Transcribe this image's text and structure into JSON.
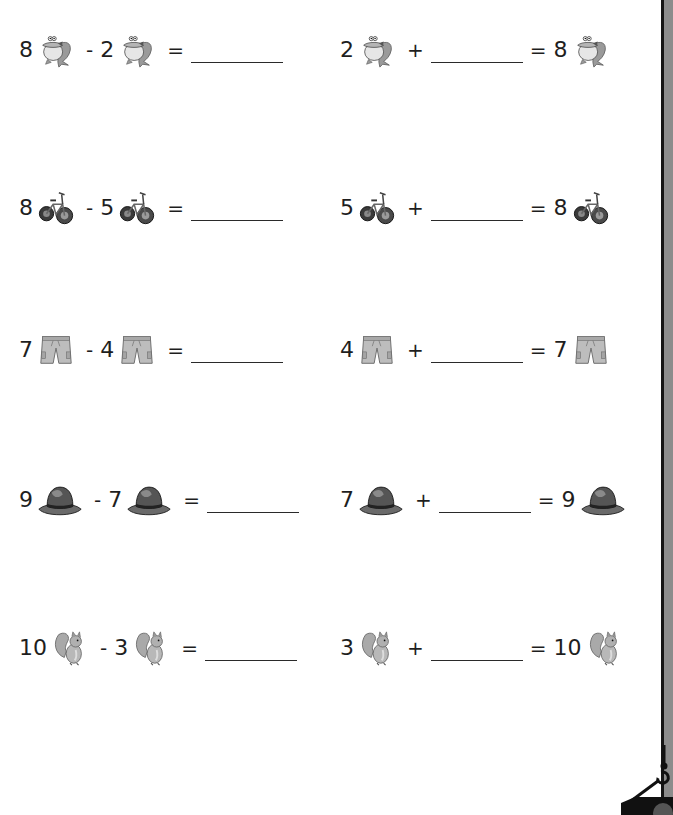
{
  "worksheet": {
    "rows": [
      {
        "item": "frog",
        "subtraction": {
          "a": "8",
          "op": "-",
          "b": "2",
          "eq": "="
        },
        "addition": {
          "a": "2",
          "op": "+",
          "eq": "=",
          "total": "8"
        }
      },
      {
        "item": "bicycle",
        "subtraction": {
          "a": "8",
          "op": "-",
          "b": "5",
          "eq": "="
        },
        "addition": {
          "a": "5",
          "op": "+",
          "eq": "=",
          "total": "8"
        }
      },
      {
        "item": "shorts",
        "subtraction": {
          "a": "7",
          "op": "-",
          "b": "4",
          "eq": "="
        },
        "addition": {
          "a": "4",
          "op": "+",
          "eq": "=",
          "total": "7"
        }
      },
      {
        "item": "hat",
        "subtraction": {
          "a": "9",
          "op": "-",
          "b": "7",
          "eq": "="
        },
        "addition": {
          "a": "7",
          "op": "+",
          "eq": "=",
          "total": "9"
        }
      },
      {
        "item": "squirrel",
        "subtraction": {
          "a": "10",
          "op": "-",
          "b": "3",
          "eq": "="
        },
        "addition": {
          "a": "3",
          "op": "+",
          "eq": "=",
          "total": "10"
        }
      }
    ]
  },
  "icons": {
    "frog": "frog-icon",
    "bicycle": "bicycle-icon",
    "shorts": "shorts-icon",
    "hat": "hat-icon",
    "squirrel": "squirrel-icon",
    "crane_hook": "crane-hook-icon"
  },
  "colors": {
    "background": "#ffffff",
    "text": "#1e1e1e",
    "edge_bar": "#8c8c8c",
    "edge_line": "#151515"
  }
}
